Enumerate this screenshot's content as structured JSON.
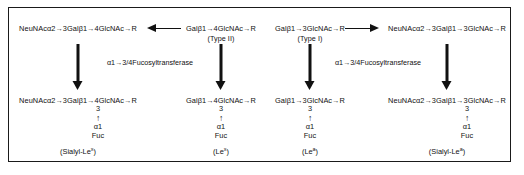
{
  "figure": {
    "border_color": "#1a1a1a",
    "background": "#ffffff",
    "ink_color": "#111111"
  },
  "pathways": {
    "type_ii_branch": {
      "precursor": {
        "label": "Galβ1→4GlcNAc→R",
        "type_name": "(Type II)"
      },
      "sialylated_precursor": {
        "label": "NeuNAcα2→3Galβ1→4GlcNAc→R"
      },
      "sialyl_product": {
        "backbone": "NeuNAcα2→3Galβ1→4GlcNAc→R",
        "linkage_position": "3",
        "linkage_arrow": "↑",
        "anomeric": "α1",
        "sugar": "Fuc",
        "name_prefix": "(Sialyl-Le",
        "name_superscript": "x",
        "name_suffix": ")"
      },
      "fucosylated_product": {
        "backbone": "Galβ1→4GlcNAc→R",
        "linkage_position": "3",
        "linkage_arrow": "↑",
        "anomeric": "α1",
        "sugar": "Fuc",
        "name_prefix": "(Le",
        "name_superscript": "x",
        "name_suffix": ")"
      },
      "enzyme": "α1→3/4Fucosyltransferase"
    },
    "type_i_branch": {
      "precursor": {
        "label": "Galβ1→3GlcNAc→R",
        "type_name": "(Type I)"
      },
      "sialylated_precursor": {
        "label": "NeuNAcα2→3Galβ1→3GlcNAc→R"
      },
      "fucosylated_product": {
        "backbone": "Galβ1→3GlcNAc→R",
        "linkage_position": "3",
        "linkage_arrow": "↑",
        "anomeric": "α1",
        "sugar": "Fuc",
        "name_prefix": "(Le",
        "name_superscript": "a",
        "name_suffix": ")"
      },
      "sialyl_product": {
        "backbone": "NeuNAcα2→3Galβ1→3GlcNAc→R",
        "linkage_position": "3",
        "linkage_arrow": "↑",
        "anomeric": "α1",
        "sugar": "Fuc",
        "name_prefix": "(Sialyl-Le",
        "name_superscript": "a",
        "name_suffix": ")"
      },
      "enzyme": "α1→3/4Fucosyltransferase"
    }
  }
}
